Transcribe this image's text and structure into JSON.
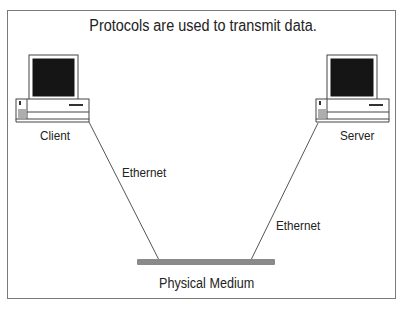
{
  "title": "Protocols are used to transmit data.",
  "nodes": {
    "client": {
      "label": "Client",
      "icon": "desktop-computer-icon"
    },
    "server": {
      "label": "Server",
      "icon": "desktop-computer-icon"
    }
  },
  "links": [
    {
      "from": "client",
      "to": "physical-medium",
      "label": "Ethernet"
    },
    {
      "from": "server",
      "to": "physical-medium",
      "label": "Ethernet"
    }
  ],
  "medium": {
    "label": "Physical Medium",
    "color": "#8a8a8a"
  },
  "colors": {
    "frame": "#7a7a7a",
    "screen": "#151515",
    "line": "#555555"
  }
}
